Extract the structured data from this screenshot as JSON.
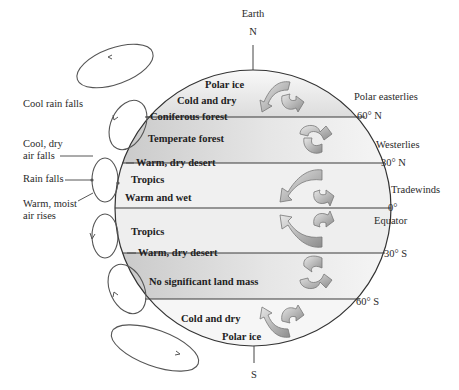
{
  "title": "Earth",
  "poles": {
    "north": "N",
    "south": "S"
  },
  "latitudes": [
    {
      "label": "60° N",
      "y": 117
    },
    {
      "label": "30° N",
      "y": 163
    },
    {
      "label": "0°",
      "y": 208
    },
    {
      "label": "30° S",
      "y": 253
    },
    {
      "label": "60° S",
      "y": 299
    }
  ],
  "winds": {
    "polar_easterlies": "Polar easterlies",
    "westerlies": "Westerlies",
    "tradewinds": "Tradewinds",
    "equator": "Equator"
  },
  "zones": {
    "north_polar_ice": "Polar ice",
    "north_cold_dry": "Cold and dry",
    "coniferous": "Coniferous forest",
    "temperate": "Temperate forest",
    "north_desert": "Warm, dry desert",
    "north_tropics": "Tropics",
    "warm_wet": "Warm and wet",
    "south_tropics": "Tropics",
    "south_desert": "Warm, dry desert",
    "no_land": "No significant land mass",
    "south_cold_dry": "Cold and dry",
    "south_polar_ice": "Polar ice"
  },
  "circulation_labels": {
    "cool_rain": "Cool rain falls",
    "cool_dry_1": "Cool, dry",
    "cool_dry_2": "air falls",
    "rain_falls": "Rain falls",
    "warm_moist_1": "Warm, moist",
    "warm_moist_2": "air rises"
  },
  "colors": {
    "globe_light": "#f4f4f4",
    "globe_dark": "#c9c9c9",
    "arrow_fill": "#b5b5b5",
    "line": "#3a3a3a"
  }
}
